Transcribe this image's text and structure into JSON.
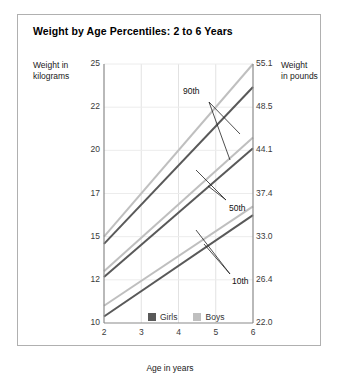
{
  "chart_title": "Weight by Age Percentiles: 2 to 6 Years",
  "axis": {
    "ylabel_left_line1": "Weight in",
    "ylabel_left_line2": "kilograms",
    "ylabel_right_line1": "Weight",
    "ylabel_right_line2": "in pounds",
    "xlabel": "Age in years"
  },
  "annotations": {
    "p90": "90th",
    "p50": "50th",
    "p10": "10th"
  },
  "legend": {
    "girls": "Girls",
    "boys": "Boys",
    "girls_color": "#595959",
    "boys_color": "#bfbfbf"
  },
  "chart_data": {
    "type": "line",
    "title": "Weight by Age Percentiles: 2 to 6 Years",
    "xlabel": "Age in years",
    "ylabel": "Weight in kilograms",
    "ylabel_secondary": "Weight in pounds",
    "grid": true,
    "legend_position": "bottom-right-inside",
    "x": [
      2,
      6
    ],
    "xlim": [
      2,
      6
    ],
    "xticks": [
      2,
      3,
      4,
      5,
      6
    ],
    "xticklabels": [
      "2",
      "3",
      "4",
      "5",
      "6"
    ],
    "ylim": [
      10,
      25
    ],
    "yticks": [
      10,
      12,
      15,
      17,
      20,
      22,
      25
    ],
    "yticklabels": [
      "10",
      "12",
      "15",
      "17",
      "20",
      "22",
      "25"
    ],
    "yticks_secondary": [
      22.0,
      26.4,
      33.0,
      37.4,
      44.1,
      48.5,
      55.1
    ],
    "yticklabels_secondary": [
      "22.0",
      "26.4",
      "33.0",
      "37.4",
      "44.1",
      "48.5",
      "55.1"
    ],
    "series": [
      {
        "name": "Boys 90th",
        "percentile": "90th",
        "sex": "Boys",
        "color": "#bfbfbf",
        "x": [
          2,
          6
        ],
        "values": [
          15.0,
          25.0
        ]
      },
      {
        "name": "Girls 90th",
        "percentile": "90th",
        "sex": "Girls",
        "color": "#595959",
        "x": [
          2,
          6
        ],
        "values": [
          14.5,
          23.4
        ]
      },
      {
        "name": "Boys 50th",
        "percentile": "50th",
        "sex": "Boys",
        "color": "#bfbfbf",
        "x": [
          2,
          6
        ],
        "values": [
          12.6,
          20.6
        ]
      },
      {
        "name": "Girls 50th",
        "percentile": "50th",
        "sex": "Girls",
        "color": "#595959",
        "x": [
          2,
          6
        ],
        "values": [
          12.2,
          20.1
        ]
      },
      {
        "name": "Boys 10th",
        "percentile": "10th",
        "sex": "Boys",
        "color": "#bfbfbf",
        "x": [
          2,
          6
        ],
        "values": [
          10.8,
          16.4
        ]
      },
      {
        "name": "Girls 10th",
        "percentile": "10th",
        "sex": "Girls",
        "color": "#595959",
        "x": [
          2,
          6
        ],
        "values": [
          10.3,
          16.0
        ]
      }
    ],
    "annotations": [
      {
        "text": "90th",
        "points_to": [
          "Boys 90th",
          "Girls 90th"
        ]
      },
      {
        "text": "50th",
        "points_to": [
          "Boys 50th",
          "Girls 50th"
        ]
      },
      {
        "text": "10th",
        "points_to": [
          "Boys 10th",
          "Girls 10th"
        ]
      }
    ]
  }
}
